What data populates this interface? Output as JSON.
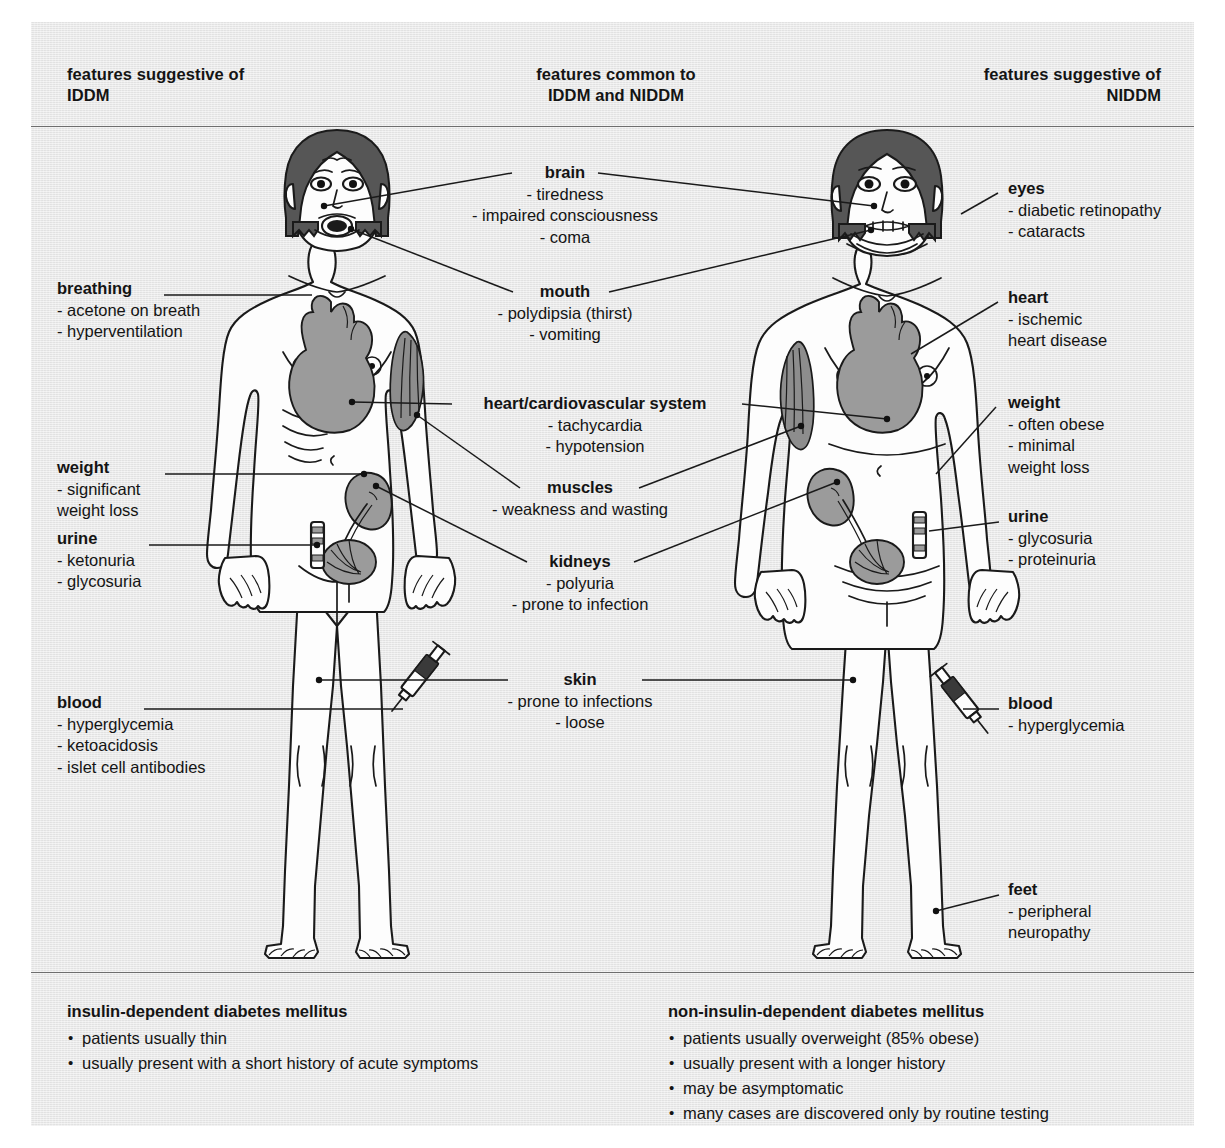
{
  "header": {
    "left": "features suggestive of\nIDDM",
    "left_line1": "features suggestive of",
    "left_line2": "IDDM",
    "middle_line1": "features common to",
    "middle_line2": "IDDM and NIDDM",
    "right_line1": "features suggestive of",
    "right_line2": "NIDDM"
  },
  "colors": {
    "panel_background": "#e8e8e8",
    "page_background": "#ffffff",
    "rule": "#6e6e6e",
    "text": "#141414",
    "organ_gray": "#9b9b9b",
    "hair_dark": "#565656",
    "muscle_gray": "#8d8d8d",
    "outline": "#1a1a1a",
    "skin_fill": "#fdfdfd"
  },
  "left_column": {
    "title": "features suggestive of IDDM",
    "items": [
      {
        "label": "breathing",
        "bullets": [
          "- acetone on breath",
          "- hyperventilation"
        ]
      },
      {
        "label": "weight",
        "bullets": [
          "- significant",
          "  weight loss"
        ]
      },
      {
        "label": "urine",
        "bullets": [
          "- ketonuria",
          "- glycosuria"
        ]
      },
      {
        "label": "blood",
        "bullets": [
          "- hyperglycemia",
          "- ketoacidosis",
          "- islet cell antibodies"
        ]
      }
    ]
  },
  "center_column": {
    "title": "features common to IDDM and NIDDM",
    "items": [
      {
        "label": "brain",
        "bullets": [
          "- tiredness",
          "- impaired consciousness",
          "- coma"
        ]
      },
      {
        "label": "mouth",
        "bullets": [
          "- polydipsia (thirst)",
          "- vomiting"
        ]
      },
      {
        "label": "heart/cardiovascular system",
        "bullets": [
          "- tachycardia",
          "- hypotension"
        ]
      },
      {
        "label": "muscles",
        "bullets": [
          "- weakness and wasting"
        ]
      },
      {
        "label": "kidneys",
        "bullets": [
          "- polyuria",
          "- prone to infection"
        ]
      },
      {
        "label": "skin",
        "bullets": [
          "- prone to infections",
          "- loose"
        ]
      }
    ]
  },
  "right_column": {
    "title": "features suggestive of NIDDM",
    "items": [
      {
        "label": "eyes",
        "bullets": [
          "- diabetic retinopathy",
          "- cataracts"
        ]
      },
      {
        "label": "heart",
        "bullets": [
          "- ischemic",
          "  heart disease"
        ]
      },
      {
        "label": "weight",
        "bullets": [
          "- often obese",
          "- minimal",
          "  weight loss"
        ]
      },
      {
        "label": "urine",
        "bullets": [
          "- glycosuria",
          "- proteinuria"
        ]
      },
      {
        "label": "blood",
        "bullets": [
          "- hyperglycemia"
        ]
      },
      {
        "label": "feet",
        "bullets": [
          "- peripheral",
          "  neuropathy"
        ]
      }
    ]
  },
  "footer": {
    "left": {
      "heading": "insulin-dependent diabetes mellitus",
      "bullets": [
        "patients usually thin",
        "usually present with a short history of acute symptoms"
      ]
    },
    "right": {
      "heading": "non-insulin-dependent diabetes mellitus",
      "bullets": [
        "patients usually overweight (85% obese)",
        "usually present with a longer history",
        "may be asymptomatic",
        "many cases are discovered only by routine testing"
      ]
    }
  },
  "figures": {
    "left_figure": {
      "name": "iddm-patient-figure",
      "description": "thin female body diagram, IDDM"
    },
    "right_figure": {
      "name": "niddm-patient-figure",
      "description": "overweight female body diagram, NIDDM"
    },
    "organs": [
      "brain-hair",
      "eyes",
      "mouth",
      "heart",
      "arm-muscle",
      "kidney",
      "bladder",
      "urine-test-strip",
      "blood-syringe"
    ]
  }
}
